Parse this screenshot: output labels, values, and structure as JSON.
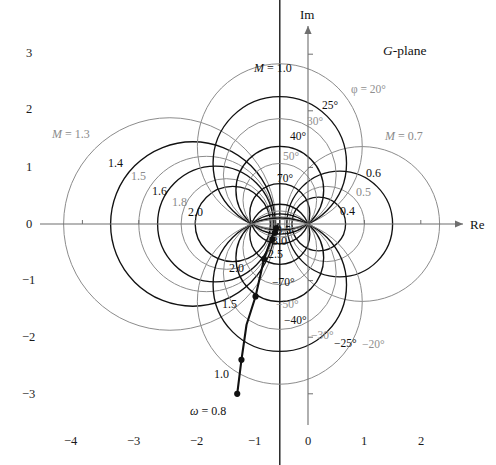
{
  "figure": {
    "plane_label": "G-plane",
    "axis_labels": {
      "imaginary": "Im",
      "real": "Re"
    }
  },
  "chart_data": {
    "type": "line",
    "title": "G-plane",
    "xlabel": "Re",
    "ylabel": "Im",
    "xlim": [
      -4.7,
      2.9
    ],
    "ylim": [
      -3.4,
      3.3
    ],
    "grid": false,
    "legend": "none",
    "x_ticks": [
      -4,
      -3,
      -2,
      -1,
      0,
      1,
      2
    ],
    "x_tick_labels": [
      "−4",
      "−3",
      "−2",
      "−1",
      "0",
      "1",
      "2"
    ],
    "y_ticks": [
      3,
      2,
      1,
      0,
      -1,
      -2,
      -3
    ],
    "y_tick_labels": [
      "3",
      "2",
      "1",
      "0",
      "−1",
      "−2",
      "−3"
    ],
    "series": [
      {
        "name": "polar frequency response",
        "comment": "open-loop G(jw) locus; points marked with filled dots at labeled frequencies",
        "x": [
          -1.255,
          -1.18,
          -1.09,
          -0.93,
          -0.78,
          -0.66,
          -0.6,
          -0.565,
          -0.545,
          -0.53
        ],
        "y": [
          -3.0,
          -2.4,
          -1.78,
          -1.28,
          -0.62,
          -0.28,
          -0.14,
          -0.07,
          -0.03,
          0.0
        ],
        "marked_points": [
          {
            "omega": "0.8",
            "label": "ω = 0.8",
            "x": -1.255,
            "y": -3.0
          },
          {
            "omega": "1.0",
            "label": "1.0",
            "x": -1.18,
            "y": -2.4
          },
          {
            "omega": "1.5",
            "label": "1.5",
            "x": -0.93,
            "y": -1.28
          },
          {
            "omega": "2.0",
            "label": "2.0",
            "x": -0.78,
            "y": -0.62
          },
          {
            "omega": "2.5",
            "label": "2.5",
            "x": -0.63,
            "y": -0.27
          },
          {
            "omega": "3.0",
            "label": "3.0",
            "x": -0.585,
            "y": -0.155
          },
          {
            "omega": "3.5",
            "label": "3.5",
            "x": -0.565,
            "y": -0.075
          }
        ]
      }
    ],
    "m_circles": {
      "description": "constant closed-loop magnitude M circles",
      "values": [
        {
          "M": 1.3,
          "label": "M = 1.3",
          "tone": "gray"
        },
        {
          "M": 1.4,
          "label": "1.4",
          "tone": "dark"
        },
        {
          "M": 1.5,
          "label": "1.5",
          "tone": "gray"
        },
        {
          "M": 1.6,
          "label": "1.6",
          "tone": "dark"
        },
        {
          "M": 1.8,
          "label": "1.8",
          "tone": "gray"
        },
        {
          "M": 2.0,
          "label": "2.0",
          "tone": "dark"
        },
        {
          "M": 1.0,
          "label": "M = 1.0",
          "tone": "dark"
        },
        {
          "M": 0.7,
          "label": "M = 0.7",
          "tone": "gray"
        },
        {
          "M": 0.6,
          "label": "0.6",
          "tone": "dark"
        },
        {
          "M": 0.5,
          "label": "0.5",
          "tone": "gray"
        },
        {
          "M": 0.4,
          "label": "0.4",
          "tone": "dark"
        }
      ]
    },
    "phase_circles": {
      "description": "constant closed-loop phase circles",
      "values": [
        {
          "phi": 20,
          "label": "φ = 20°",
          "tone": "gray"
        },
        {
          "phi": 25,
          "label": "25°",
          "tone": "dark"
        },
        {
          "phi": 30,
          "label": "30°",
          "tone": "gray"
        },
        {
          "phi": 40,
          "label": "40°",
          "tone": "dark"
        },
        {
          "phi": 50,
          "label": "50°",
          "tone": "gray"
        },
        {
          "phi": 70,
          "label": "70°",
          "tone": "dark"
        },
        {
          "phi": -70,
          "label": "−70°",
          "tone": "dark"
        },
        {
          "phi": -50,
          "label": "−50°",
          "tone": "gray"
        },
        {
          "phi": -40,
          "label": "−40°",
          "tone": "dark"
        },
        {
          "phi": -30,
          "label": "−30°",
          "tone": "gray"
        },
        {
          "phi": -25,
          "label": "−25°",
          "tone": "dark"
        },
        {
          "phi": -20,
          "label": "−20°",
          "tone": "gray"
        }
      ]
    },
    "colors": {
      "dark_curve": "#111111",
      "gray_curve": "#8c8c8c",
      "axis": "#6e6e6e",
      "text": "#111111"
    }
  },
  "labels": {
    "m_left": [
      {
        "text": "M = 1.3",
        "tone": "gray",
        "x": 52,
        "y": 128,
        "italic_prefix": true
      },
      {
        "text": "1.4",
        "tone": "dark",
        "x": 108,
        "y": 157
      },
      {
        "text": "1.5",
        "tone": "gray",
        "x": 131,
        "y": 170
      },
      {
        "text": "1.6",
        "tone": "dark",
        "x": 152,
        "y": 185
      },
      {
        "text": "1.8",
        "tone": "gray",
        "x": 172,
        "y": 196
      },
      {
        "text": "2.0",
        "tone": "dark",
        "x": 188,
        "y": 206
      }
    ],
    "m_right": [
      {
        "text": "M = 0.7",
        "tone": "gray",
        "x": 385,
        "y": 130,
        "italic_prefix": true
      },
      {
        "text": "0.6",
        "tone": "dark",
        "x": 366,
        "y": 167
      },
      {
        "text": "0.5",
        "tone": "gray",
        "x": 356,
        "y": 186
      },
      {
        "text": "0.4",
        "tone": "dark",
        "x": 340,
        "y": 205
      }
    ],
    "m_top": {
      "text": "M = 1.0",
      "tone": "dark",
      "x": 254,
      "y": 62,
      "italic_prefix": true
    },
    "phase_pos": [
      {
        "text": "φ = 20°",
        "tone": "gray",
        "x": 351,
        "y": 84
      },
      {
        "text": "25°",
        "tone": "dark",
        "x": 322,
        "y": 100
      },
      {
        "text": "30°",
        "tone": "gray",
        "x": 307,
        "y": 116
      },
      {
        "text": "40°",
        "tone": "dark",
        "x": 290,
        "y": 131
      },
      {
        "text": "50°",
        "tone": "gray",
        "x": 283,
        "y": 151
      },
      {
        "text": "70°",
        "tone": "dark",
        "x": 277,
        "y": 173
      }
    ],
    "phase_neg": [
      {
        "text": "−70°",
        "tone": "dark",
        "x": 272,
        "y": 277
      },
      {
        "text": "−50°",
        "tone": "gray",
        "x": 276,
        "y": 299
      },
      {
        "text": "−40°",
        "tone": "dark",
        "x": 284,
        "y": 315
      },
      {
        "text": "−30°",
        "tone": "gray",
        "x": 311,
        "y": 330
      },
      {
        "text": "−25°",
        "tone": "dark",
        "x": 334,
        "y": 338
      },
      {
        "text": "−20°",
        "tone": "gray",
        "x": 362,
        "y": 339
      }
    ],
    "omega": [
      {
        "text": "ω = 0.8",
        "x": 190,
        "y": 405,
        "italic_prefix": true
      },
      {
        "text": "1.0",
        "x": 214,
        "y": 368
      },
      {
        "text": "1.5",
        "x": 222,
        "y": 298
      },
      {
        "text": "2.0",
        "x": 229,
        "y": 262
      },
      {
        "text": "2.5",
        "x": 268,
        "y": 248
      },
      {
        "text": "3.0",
        "x": 272,
        "y": 235
      },
      {
        "text": "3.5",
        "x": 276,
        "y": 224
      }
    ],
    "x_axis": [
      {
        "text": "−4",
        "x": 64,
        "y": 435
      },
      {
        "text": "−3",
        "x": 127,
        "y": 435
      },
      {
        "text": "−2",
        "x": 190,
        "y": 435
      },
      {
        "text": "−1",
        "x": 248,
        "y": 435
      },
      {
        "text": "0",
        "x": 305,
        "y": 435
      },
      {
        "text": "1",
        "x": 361,
        "y": 435
      },
      {
        "text": "2",
        "x": 418,
        "y": 435
      }
    ],
    "y_axis": [
      {
        "text": "3",
        "x": 26,
        "y": 47
      },
      {
        "text": "2",
        "x": 26,
        "y": 103
      },
      {
        "text": "1",
        "x": 26,
        "y": 161
      },
      {
        "text": "0",
        "x": 26,
        "y": 218
      },
      {
        "text": "−1",
        "x": 22,
        "y": 274
      },
      {
        "text": "−2",
        "x": 22,
        "y": 331
      },
      {
        "text": "−3",
        "x": 22,
        "y": 388
      }
    ]
  }
}
